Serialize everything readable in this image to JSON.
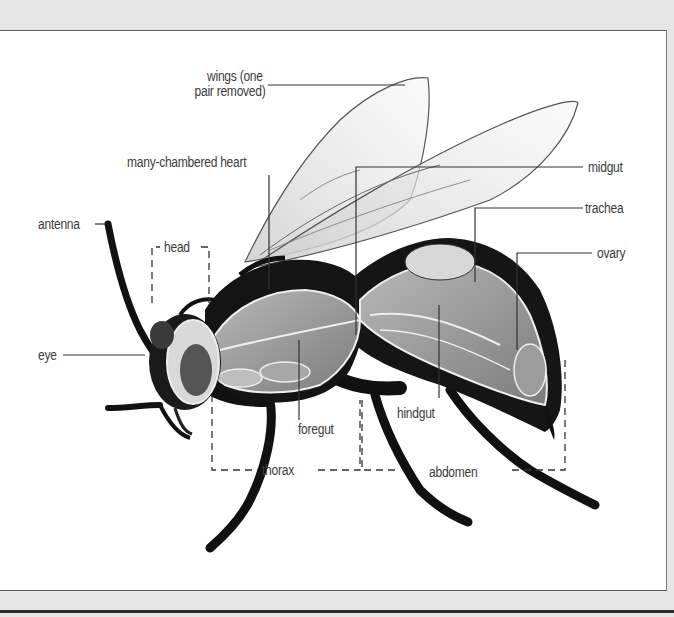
{
  "diagram": {
    "labels": {
      "wings": "wings (one",
      "wings_line2": "pair removed)",
      "heart": "many-chambered heart",
      "antenna": "antenna",
      "head": "head",
      "eye": "eye",
      "midgut": "midgut",
      "trachea": "trachea",
      "ovary": "ovary",
      "foregut": "foregut",
      "hindgut": "hindgut",
      "thorax": "thorax",
      "abdomen": "abdomen"
    },
    "body_regions": [
      "head",
      "thorax",
      "abdomen"
    ],
    "colors": {
      "background_outer": "#e6e6e6",
      "panel": "#ffffff",
      "label_text": "#3c3c3c",
      "leader_line": "#333333",
      "insect_dark": "#111111",
      "organ_gray": "#9a9a9a"
    }
  }
}
